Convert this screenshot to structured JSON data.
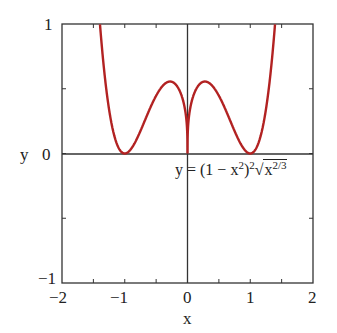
{
  "chart_data": {
    "type": "line",
    "title": "",
    "xlabel": "x",
    "ylabel": "y",
    "xlim": [
      -2,
      2
    ],
    "ylim": [
      -1,
      1
    ],
    "grid": false,
    "x_ticks": [
      -2,
      -1,
      0,
      1,
      2
    ],
    "x_tick_labels": [
      "−2",
      "−1",
      "0",
      "1",
      "2"
    ],
    "y_ticks": [
      -1,
      0,
      1
    ],
    "y_tick_labels": [
      "−1",
      "0",
      "1"
    ],
    "annotation": {
      "text": "y = (1 − x²)²√x^(2/3)",
      "position": "below x-axis, right of origin"
    },
    "series": [
      {
        "name": "y = (1 - x^2)^2 * (x^(2/3))^(1/2)",
        "color": "#b22222",
        "function": "(1-x^2)^2*|x|^(1/3)",
        "x": [
          -1.4,
          -1.3,
          -1.2,
          -1.1,
          -1.0,
          -0.9,
          -0.8,
          -0.6,
          -0.4,
          -0.25,
          -0.1,
          0,
          0.1,
          0.25,
          0.4,
          0.6,
          0.8,
          0.9,
          1.0,
          1.1,
          1.2,
          1.3,
          1.4
        ],
        "values": [
          1.03,
          0.65,
          0.21,
          0.05,
          0.0,
          0.03,
          0.12,
          0.35,
          0.52,
          0.55,
          0.45,
          0.0,
          0.45,
          0.55,
          0.52,
          0.35,
          0.12,
          0.03,
          0.0,
          0.05,
          0.21,
          0.65,
          1.03
        ]
      }
    ]
  },
  "labels": {
    "x_axis": "x",
    "y_axis": "y",
    "eq_prefix": "y = (1 − x",
    "eq_sq": "2",
    "eq_mid": ")",
    "eq_sq2": "2",
    "eq_rad": "√",
    "eq_x": "x",
    "eq_exp": "2/3",
    "xt0": "−2",
    "xt1": "−1",
    "xt2": "0",
    "xt3": "1",
    "xt4": "2",
    "yt0": "−1",
    "yt1": "0",
    "yt2": "1"
  }
}
